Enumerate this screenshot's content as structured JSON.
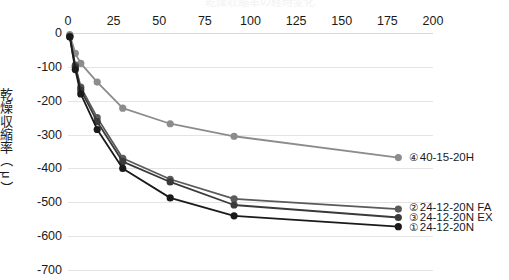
{
  "clipped_title": "乾燥収縮率の経時変化",
  "axes": {
    "x": {
      "ticks": [
        0,
        25,
        50,
        75,
        100,
        125,
        150,
        175,
        200
      ],
      "min": 0,
      "max": 200,
      "label": ""
    },
    "y": {
      "ticks": [
        0,
        -100,
        -200,
        -300,
        -400,
        -500,
        -600,
        -700
      ],
      "min": -700,
      "max": 0,
      "label_chars": [
        "乾",
        "燥",
        "収",
        "縮",
        "率",
        "（",
        "μ",
        "）"
      ],
      "label": "乾燥収縮率（μ）"
    }
  },
  "series_labels": [
    {
      "marker": "④",
      "name": "40-15-20H"
    },
    {
      "marker": "②",
      "name": "24-12-20N FA"
    },
    {
      "marker": "③",
      "name": "24-12-20N EX"
    },
    {
      "marker": "①",
      "name": "24-12-20N"
    }
  ],
  "chart_data": {
    "type": "line",
    "title": "乾燥収縮率の経時変化",
    "xlabel": "",
    "ylabel": "乾燥収縮率（μ）",
    "xlim": [
      0,
      200
    ],
    "ylim": [
      -700,
      0
    ],
    "grid": true,
    "legend_position": "right-inline",
    "xticks": [
      0,
      25,
      50,
      75,
      100,
      125,
      150,
      175,
      200
    ],
    "yticks": [
      0,
      -100,
      -200,
      -300,
      -400,
      -500,
      -600,
      -700
    ],
    "series": [
      {
        "name": "④ 40-15-20H",
        "marker": "④",
        "color": "#8c8c8c",
        "x": [
          1,
          4,
          7,
          16,
          30,
          56,
          91,
          181
        ],
        "y": [
          -5,
          -60,
          -90,
          -145,
          -222,
          -268,
          -305,
          -368
        ]
      },
      {
        "name": "② 24-12-20N FA",
        "marker": "②",
        "color": "#5a5a5a",
        "x": [
          1,
          4,
          7,
          16,
          30,
          56,
          91,
          181
        ],
        "y": [
          -10,
          -95,
          -160,
          -250,
          -370,
          -432,
          -490,
          -520
        ]
      },
      {
        "name": "③ 24-12-20N EX",
        "marker": "③",
        "color": "#3a3a3a",
        "x": [
          1,
          4,
          7,
          16,
          30,
          56,
          91,
          181
        ],
        "y": [
          -10,
          -100,
          -168,
          -262,
          -380,
          -440,
          -508,
          -545
        ]
      },
      {
        "name": "① 24-12-20N",
        "marker": "①",
        "color": "#1a1a1a",
        "x": [
          1,
          4,
          7,
          16,
          30,
          56,
          91,
          181
        ],
        "y": [
          -12,
          -108,
          -180,
          -285,
          -400,
          -487,
          -540,
          -572
        ]
      }
    ]
  }
}
